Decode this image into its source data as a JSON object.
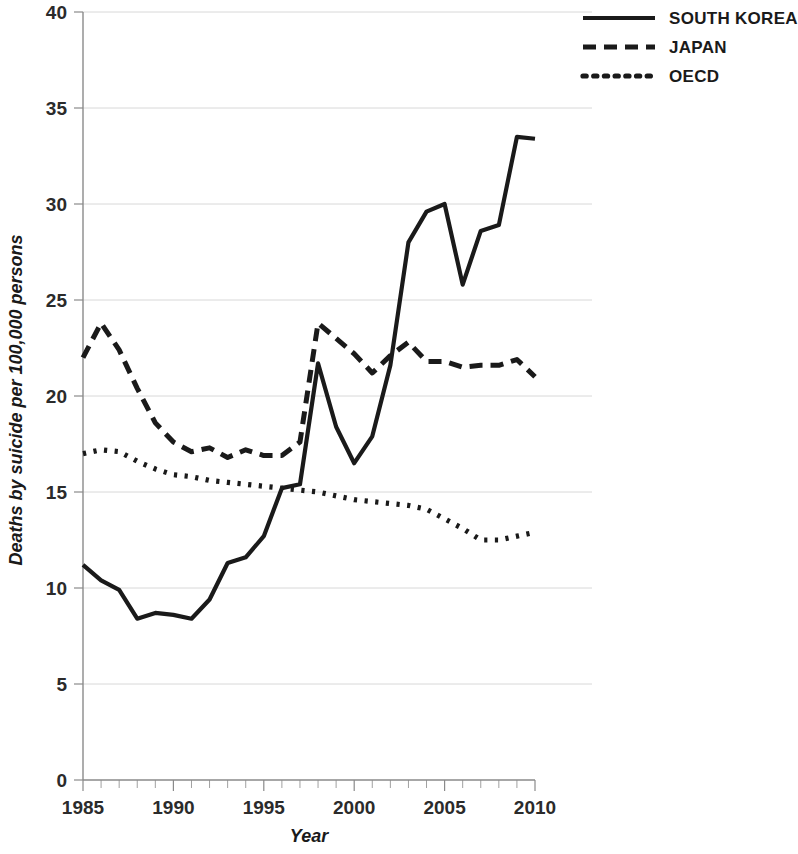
{
  "chart_data": {
    "type": "line",
    "title": "",
    "xlabel": "Year",
    "ylabel": "Deaths by suicide per 100,000 persons",
    "xlim": [
      1985,
      2010
    ],
    "ylim": [
      0,
      40
    ],
    "ytick_step": 5,
    "xtick_step": 5,
    "x_minor_tick_step": 1,
    "grid": true,
    "grid_axis": "y",
    "legend_position": "top-right",
    "x": [
      1985,
      1986,
      1987,
      1988,
      1989,
      1990,
      1991,
      1992,
      1993,
      1994,
      1995,
      1996,
      1997,
      1998,
      1999,
      2000,
      2001,
      2002,
      2003,
      2004,
      2005,
      2006,
      2007,
      2008,
      2009,
      2010
    ],
    "xticks": [
      "1985",
      "1990",
      "1995",
      "2000",
      "2005",
      "2010"
    ],
    "yticks": [
      "0",
      "5",
      "10",
      "15",
      "20",
      "25",
      "30",
      "35",
      "40"
    ],
    "series": [
      {
        "name": "SOUTH KOREA",
        "style": "solid",
        "color": "#1a1a1a",
        "values": [
          11.2,
          10.4,
          9.9,
          8.4,
          8.7,
          8.6,
          8.4,
          9.4,
          11.3,
          11.6,
          12.7,
          15.2,
          15.4,
          21.7,
          18.4,
          16.5,
          17.9,
          21.6,
          28.0,
          29.6,
          30.0,
          25.8,
          28.6,
          28.9,
          33.5,
          33.4
        ]
      },
      {
        "name": "JAPAN",
        "style": "dashed",
        "color": "#1a1a1a",
        "values": [
          22.0,
          23.8,
          22.4,
          20.4,
          18.6,
          17.6,
          17.1,
          17.3,
          16.8,
          17.2,
          16.9,
          16.9,
          17.6,
          23.8,
          23.0,
          22.2,
          21.2,
          22.1,
          22.8,
          21.8,
          21.8,
          21.5,
          21.6,
          21.6,
          21.9,
          21.0
        ]
      },
      {
        "name": "OECD",
        "style": "dotted",
        "color": "#1a1a1a",
        "values": [
          17.0,
          17.2,
          17.1,
          16.6,
          16.2,
          15.9,
          15.8,
          15.6,
          15.5,
          15.4,
          15.3,
          15.2,
          15.1,
          15.0,
          14.8,
          14.6,
          14.5,
          14.4,
          14.3,
          14.1,
          13.6,
          13.1,
          12.5,
          12.5,
          12.7,
          12.9
        ]
      }
    ]
  },
  "legend": {
    "items": [
      {
        "label": "SOUTH KOREA",
        "style": "solid"
      },
      {
        "label": "JAPAN",
        "style": "dashed"
      },
      {
        "label": "OECD",
        "style": "dotted"
      }
    ]
  },
  "axes": {
    "x_title": "Year",
    "y_title": "Deaths by suicide per 100,000 persons"
  }
}
